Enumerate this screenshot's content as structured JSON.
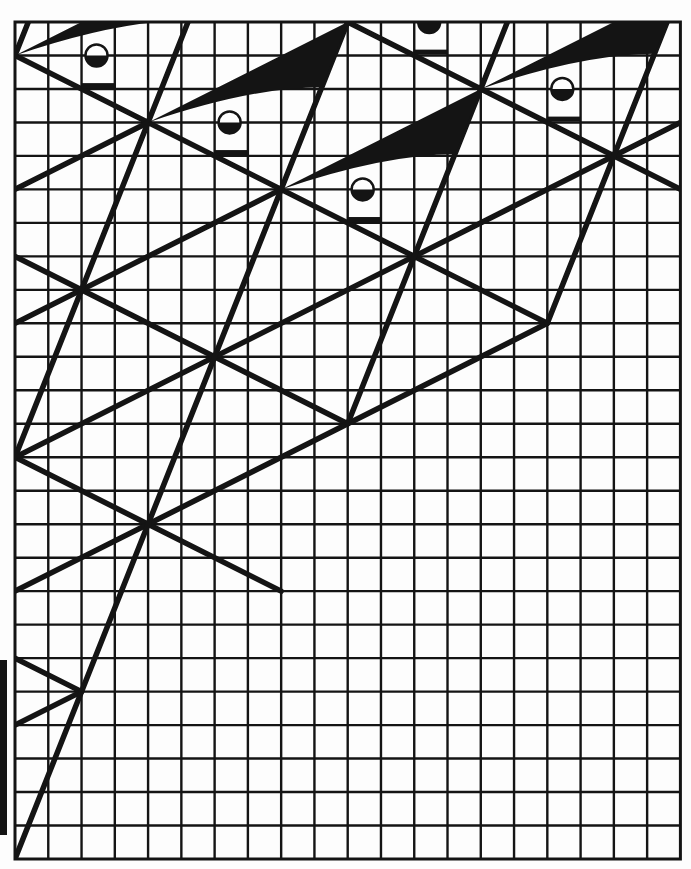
{
  "figure": {
    "colors": {
      "ink": "#141414",
      "paper": "#fdfdfd"
    },
    "grid": {
      "origin_x": 15,
      "origin_y": 22,
      "cell_w": 33.27,
      "cell_h": 33.48,
      "cols": 20,
      "rows": 25,
      "line_width": 2.4,
      "border_width": 3
    },
    "stroke_width": 5.5,
    "nodes": [
      [
        0,
        1
      ],
      [
        4,
        3
      ],
      [
        8,
        5
      ],
      [
        12,
        7
      ],
      [
        14,
        2
      ],
      [
        18,
        4
      ],
      [
        2,
        8
      ],
      [
        6,
        10
      ],
      [
        0,
        13
      ],
      [
        4,
        15
      ],
      [
        2,
        20
      ],
      [
        16,
        9
      ],
      [
        10,
        12
      ],
      [
        8,
        17
      ]
    ],
    "segments": [
      {
        "name": "desc-line-a",
        "from": [
          0,
          1
        ],
        "to": [
          16,
          9
        ]
      },
      {
        "name": "desc-line-b",
        "from": [
          10,
          0
        ],
        "to": [
          20,
          5
        ]
      },
      {
        "name": "desc-line-c",
        "from": [
          0,
          7
        ],
        "to": [
          10,
          12
        ]
      },
      {
        "name": "desc-line-d",
        "from": [
          0,
          13
        ],
        "to": [
          8,
          17
        ]
      },
      {
        "name": "desc-line-e",
        "from": [
          0,
          19
        ],
        "to": [
          2,
          20
        ]
      },
      {
        "name": "asc-line-a",
        "from": [
          0,
          5
        ],
        "to": [
          4,
          3
        ]
      },
      {
        "name": "asc-line-b",
        "from": [
          0,
          9
        ],
        "to": [
          8,
          5
        ]
      },
      {
        "name": "asc-line-c",
        "from": [
          0,
          13
        ],
        "to": [
          12,
          7
        ]
      },
      {
        "name": "asc-line-d",
        "from": [
          12,
          7
        ],
        "to": [
          20,
          3
        ]
      },
      {
        "name": "asc-line-e",
        "from": [
          0,
          17
        ],
        "to": [
          16,
          9
        ]
      },
      {
        "name": "asc-line-f",
        "from": [
          0,
          21
        ],
        "to": [
          2,
          20
        ]
      },
      {
        "name": "steep-line-a",
        "from": [
          0.4,
          0
        ],
        "to": [
          0,
          1
        ]
      },
      {
        "name": "steep-line-b",
        "from": [
          5.2,
          0
        ],
        "to": [
          0,
          13
        ]
      },
      {
        "name": "steep-line-c",
        "from": [
          10,
          0
        ],
        "to": [
          0,
          25
        ]
      },
      {
        "name": "steep-line-d",
        "from": [
          14.8,
          0
        ],
        "to": [
          10,
          12
        ]
      },
      {
        "name": "steep-line-e",
        "from": [
          19.6,
          0
        ],
        "to": [
          16,
          9
        ]
      }
    ],
    "wings": [
      {
        "name": "wing-1",
        "tip": [
          0,
          1
        ]
      },
      {
        "name": "wing-2",
        "tip": [
          4,
          3
        ]
      },
      {
        "name": "wing-3",
        "tip": [
          8,
          5
        ]
      },
      {
        "name": "wing-4",
        "tip": [
          10,
          0
        ]
      },
      {
        "name": "wing-5",
        "tip": [
          14,
          2
        ]
      }
    ],
    "wing_shape": {
      "top": [
        6,
        -3
      ],
      "bottom_end": [
        5.22,
        -1.05
      ],
      "curve_ctrl": [
        3.1,
        -1.05
      ]
    },
    "circle_offset": [
      2.45,
      0
    ],
    "circle_radius": 11,
    "bar_offset": {
      "x1": 2,
      "x2": 3,
      "dy": 0.9
    },
    "margin_bar": {
      "top": 660,
      "height": 175
    }
  }
}
